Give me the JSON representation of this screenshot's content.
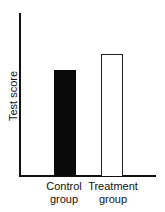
{
  "chart_data": {
    "type": "bar",
    "title": "",
    "xlabel": "",
    "ylabel": "Test score",
    "categories": [
      "Control group",
      "Treatment group"
    ],
    "category_lines": [
      [
        "Control",
        "group"
      ],
      [
        "Treatment",
        "group"
      ]
    ],
    "values": [
      65,
      75
    ],
    "value_scale_note": "No numeric ticks shown; values are relative heights (axis height = 100)",
    "ylim": [
      0,
      100
    ],
    "grid": false,
    "legend": null,
    "bar_styles": [
      {
        "category": "Control group",
        "fill": "#0a0a0a",
        "outline": "#0a0a0a"
      },
      {
        "category": "Treatment group",
        "fill": "#ffffff",
        "outline": "#222222"
      }
    ]
  }
}
